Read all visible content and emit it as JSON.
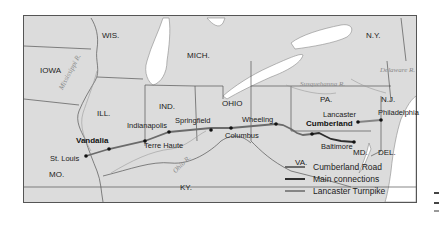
{
  "map": {
    "states": {
      "wis": "WIS.",
      "mich": "MICH.",
      "iowa": "IOWA",
      "ill": "ILL.",
      "ind": "IND.",
      "ohio": "OHIO",
      "ny": "N.Y.",
      "pa": "PA.",
      "nj": "N.J.",
      "mo": "MO.",
      "ky": "KY.",
      "va": "VA.",
      "md": "MD.",
      "del": "DEL."
    },
    "rivers": {
      "mississippi": "Mississippi R.",
      "ohio": "Ohio R.",
      "susquehanna": "Susquehanna R.",
      "delaware": "Delaware R."
    },
    "cities": {
      "vandalia": "Vandalia",
      "st_louis": "St. Louis",
      "indianapolis": "Indianapolis",
      "terre_haute": "Terre Haute",
      "springfield": "Springfield",
      "columbus": "Columbus",
      "wheeling": "Wheeling",
      "cumberland": "Cumberland",
      "baltimore": "Baltimore",
      "lancaster": "Lancaster",
      "philadelphia": "Philadelphia"
    },
    "colors": {
      "land": "#dcdcdc",
      "water": "#ffffff",
      "border": "#555555",
      "cumberland_road": "#6b6b6b",
      "main_connections": "#2e2e2e",
      "lancaster_turnpike": "#858585"
    }
  },
  "legend": {
    "items": [
      {
        "label": "Cumberland Road",
        "color": "#6b6b6b"
      },
      {
        "label": "Main connections",
        "color": "#2e2e2e"
      },
      {
        "label": "Lancaster Turnpike",
        "color": "#858585"
      }
    ]
  }
}
